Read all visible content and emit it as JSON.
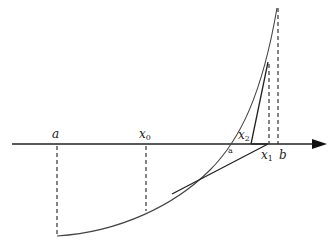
{
  "diagram": {
    "labels": {
      "a": {
        "text": "a",
        "sub": ""
      },
      "x0": {
        "text": "x",
        "sub": "0"
      },
      "x1": {
        "text": "x",
        "sub": "1"
      },
      "x2": {
        "text": "x",
        "sub": "2"
      },
      "b": {
        "text": "b",
        "sub": ""
      },
      "small_a": {
        "text": "a"
      }
    },
    "colors": {
      "axis": "#222222",
      "curve": "#444444",
      "tangent": "#222222",
      "dashed": "#333333"
    }
  }
}
